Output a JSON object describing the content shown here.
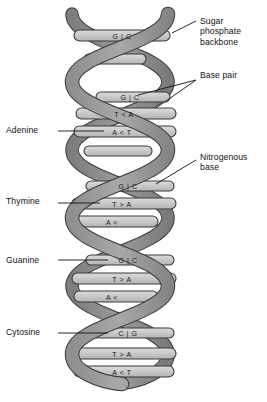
{
  "figure": {
    "colors": {
      "background": "#ffffff",
      "backbone_ribbon": "#8a8a8a",
      "backbone_ribbon_shade": "#767676",
      "rung_fill": "#c8c8c8",
      "rung_fill_light": "#d6d6d6",
      "outline": "#3a3a3a",
      "text": "#111111"
    }
  },
  "callouts": {
    "right": [
      {
        "id": "sugar-phosphate-backbone",
        "text": "Sugar\nphosphate\nbackbone"
      },
      {
        "id": "base-pair",
        "text": "Base pair"
      },
      {
        "id": "nitrogenous-base",
        "text": "Nitrogenous\nbase"
      }
    ],
    "left": [
      {
        "id": "adenine",
        "text": "Adenine"
      },
      {
        "id": "thymine",
        "text": "Thymine"
      },
      {
        "id": "guanine",
        "text": "Guanine"
      },
      {
        "id": "cytosine",
        "text": "Cytosine"
      }
    ]
  },
  "base_pairs": [
    {
      "index": 1,
      "left": "G",
      "right": "C",
      "connector": "|",
      "label": "G | C",
      "y": 36
    },
    {
      "index": 2,
      "left": "G",
      "right": "C",
      "connector": "|",
      "label": "G | C",
      "y": 97
    },
    {
      "index": 3,
      "left": "T",
      "right": "A",
      "connector": "<",
      "label": "T < A",
      "y": 113
    },
    {
      "index": 4,
      "left": "A",
      "right": "T",
      "connector": "<",
      "label": "A < T",
      "y": 131
    },
    {
      "index": 5,
      "left": "G",
      "right": "C",
      "connector": "|",
      "label": "G | C",
      "y": 186
    },
    {
      "index": 6,
      "left": "T",
      "right": "A",
      "connector": ">",
      "label": "T > A",
      "y": 203
    },
    {
      "index": 7,
      "left": "A",
      "right": "",
      "connector": "<",
      "label": "A <",
      "y": 221
    },
    {
      "index": 8,
      "left": "G",
      "right": "C",
      "connector": "|",
      "label": "G | C",
      "y": 260
    },
    {
      "index": 9,
      "left": "T",
      "right": "A",
      "connector": ">",
      "label": "T > A",
      "y": 278
    },
    {
      "index": 10,
      "left": "A",
      "right": "",
      "connector": "<",
      "label": "A <",
      "y": 296
    },
    {
      "index": 11,
      "left": "C",
      "right": "G",
      "connector": "|",
      "label": "C | G",
      "y": 333
    },
    {
      "index": 12,
      "left": "T",
      "right": "A",
      "connector": ">",
      "label": "T > A",
      "y": 353
    },
    {
      "index": 13,
      "left": "A",
      "right": "T",
      "connector": "<",
      "label": "A < T",
      "y": 371
    }
  ]
}
